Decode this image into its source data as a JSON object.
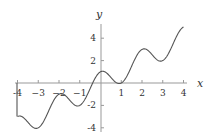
{
  "chart_data": {
    "type": "line",
    "title": "",
    "function": "y = x + cos(pi x)",
    "xlabel": "x",
    "ylabel": "y",
    "xlim": [
      -4,
      4
    ],
    "ylim": [
      -4,
      5
    ],
    "grid": false,
    "x_ticks": [
      -4,
      -3,
      -2,
      -1,
      1,
      2,
      3,
      4
    ],
    "x_tick_labels": [
      "-4",
      "−3",
      "−2",
      "−1",
      "1",
      "2",
      "3",
      "4"
    ],
    "y_ticks": [
      4,
      2,
      -2,
      -4
    ],
    "y_tick_labels": [
      "4",
      "2",
      "-2",
      "-4"
    ],
    "series": [
      {
        "name": "f(x)",
        "x": [
          -4,
          -3.5,
          -3,
          -2.5,
          -2,
          -1.5,
          -1,
          -0.5,
          0,
          0.5,
          1,
          1.5,
          2,
          2.5,
          3,
          3.5,
          4
        ],
        "values": [
          -3,
          -3.5,
          -4,
          -2.5,
          -1,
          -1.5,
          -2,
          -0.5,
          1,
          0.5,
          0,
          1.5,
          3,
          2.5,
          2,
          3.5,
          5
        ]
      }
    ],
    "annotations": [
      "vertical segment at x=-4 from y=0 to y=-3"
    ]
  },
  "colors": {
    "curve": "#555555",
    "axis": "#999999",
    "text": "#333333"
  }
}
